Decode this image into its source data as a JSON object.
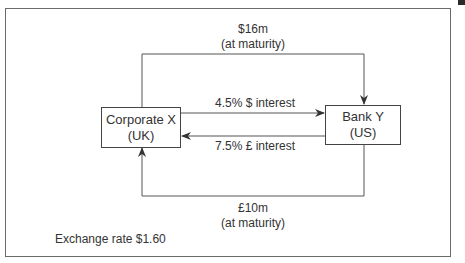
{
  "diagram": {
    "nodes": [
      {
        "id": "corporate-x",
        "line1": "Corporate X",
        "line2": "(UK)"
      },
      {
        "id": "bank-y",
        "line1": "Bank Y",
        "line2": "(US)"
      }
    ],
    "edges": [
      {
        "from": "corporate-x",
        "to": "bank-y",
        "label_line1": "$16m",
        "label_line2": "(at maturity)",
        "route": "top"
      },
      {
        "from": "corporate-x",
        "to": "bank-y",
        "label": "4.5% $ interest",
        "route": "middle-upper"
      },
      {
        "from": "bank-y",
        "to": "corporate-x",
        "label": "7.5% £ interest",
        "route": "middle-lower"
      },
      {
        "from": "bank-y",
        "to": "corporate-x",
        "label_line1": "£10m",
        "label_line2": "(at maturity)",
        "route": "bottom"
      }
    ],
    "note": "Exchange rate $1.60",
    "colors": {
      "line": "#444444",
      "frame": "#6a6a6a",
      "text": "#333333"
    }
  }
}
